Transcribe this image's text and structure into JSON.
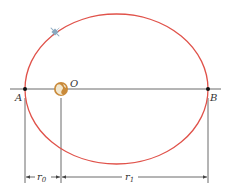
{
  "diagram": {
    "type": "elliptical-orbit",
    "colors": {
      "orbit": "#e0524a",
      "lines": "#444444",
      "earth_ocean": "#c98a3a",
      "earth_land": "#f2e8d0",
      "satellite": "#8aa8bf"
    },
    "points": {
      "A": {
        "label": "A",
        "x": 25,
        "y": 89
      },
      "B": {
        "label": "B",
        "x": 208,
        "y": 89
      },
      "O": {
        "label": "O",
        "x": 61,
        "y": 89
      }
    },
    "orbit": {
      "cx": 116.5,
      "cy": 89,
      "rx": 91.5,
      "ry": 75
    },
    "satellite": {
      "x": 55,
      "y": 32
    },
    "dimensions": {
      "r0": {
        "label": "r",
        "subscript": "0",
        "from_x": 25,
        "to_x": 61,
        "y": 177
      },
      "r1": {
        "label": "r",
        "subscript": "1",
        "from_x": 61,
        "to_x": 208,
        "y": 177
      }
    }
  }
}
